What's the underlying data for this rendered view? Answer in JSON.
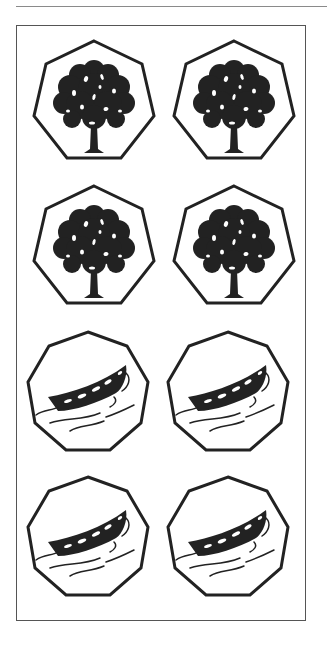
{
  "page": {
    "rule_color": "#8a8a8a",
    "border_color": "#555555",
    "ink_color": "#222222"
  },
  "tiles": [
    {
      "row": 1,
      "col": 1,
      "shape": "heptagon",
      "icon": "tree-icon"
    },
    {
      "row": 1,
      "col": 2,
      "shape": "heptagon",
      "icon": "tree-icon"
    },
    {
      "row": 2,
      "col": 1,
      "shape": "heptagon",
      "icon": "tree-icon"
    },
    {
      "row": 2,
      "col": 2,
      "shape": "heptagon",
      "icon": "tree-icon"
    },
    {
      "row": 3,
      "col": 1,
      "shape": "nonagon",
      "icon": "boat-icon"
    },
    {
      "row": 3,
      "col": 2,
      "shape": "nonagon",
      "icon": "boat-icon"
    },
    {
      "row": 4,
      "col": 1,
      "shape": "nonagon",
      "icon": "boat-icon"
    },
    {
      "row": 4,
      "col": 2,
      "shape": "nonagon",
      "icon": "boat-icon"
    }
  ]
}
